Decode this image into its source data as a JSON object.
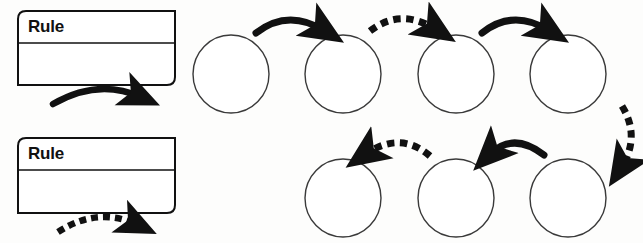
{
  "diagram": {
    "background_color": "#fdfdfc",
    "stroke_color": "#111111",
    "legend": {
      "items": [
        {
          "name": "rule-box-solid",
          "label": "Rule",
          "arrow_style": "solid",
          "arrow_direction": "right",
          "x": 18,
          "y": 11,
          "width": 157,
          "height": 74
        },
        {
          "name": "rule-box-dashed",
          "label": "Rule",
          "arrow_style": "dashed",
          "arrow_direction": "right",
          "x": 18,
          "y": 138,
          "width": 157,
          "height": 75
        }
      ]
    },
    "nodes": [
      {
        "id": "node-1",
        "row": "top",
        "index": 1,
        "cx": 231,
        "cy": 74,
        "rx": 38,
        "ry": 39,
        "label": ""
      },
      {
        "id": "node-2",
        "row": "top",
        "index": 2,
        "cx": 343,
        "cy": 74,
        "rx": 38,
        "ry": 39,
        "label": ""
      },
      {
        "id": "node-3",
        "row": "top",
        "index": 3,
        "cx": 456,
        "cy": 74,
        "rx": 38,
        "ry": 39,
        "label": ""
      },
      {
        "id": "node-4",
        "row": "top",
        "index": 4,
        "cx": 568,
        "cy": 74,
        "rx": 38,
        "ry": 39,
        "label": ""
      },
      {
        "id": "node-5",
        "row": "bottom",
        "index": 5,
        "cx": 568,
        "cy": 198,
        "rx": 38,
        "ry": 39,
        "label": ""
      },
      {
        "id": "node-6",
        "row": "bottom",
        "index": 6,
        "cx": 456,
        "cy": 198,
        "rx": 38,
        "ry": 39,
        "label": ""
      },
      {
        "id": "node-7",
        "row": "bottom",
        "index": 7,
        "cx": 343,
        "cy": 198,
        "rx": 38,
        "ry": 39,
        "label": ""
      }
    ],
    "connectors": [
      {
        "id": "arrow-1-2",
        "from": "node-1",
        "to": "node-2",
        "style": "solid",
        "direction": "right",
        "label": ""
      },
      {
        "id": "arrow-2-3",
        "from": "node-2",
        "to": "node-3",
        "style": "dashed",
        "direction": "right",
        "label": ""
      },
      {
        "id": "arrow-3-4",
        "from": "node-3",
        "to": "node-4",
        "style": "solid",
        "direction": "right",
        "label": ""
      },
      {
        "id": "arrow-4-5",
        "from": "node-4",
        "to": "node-5",
        "style": "dashed",
        "direction": "down",
        "label": ""
      },
      {
        "id": "arrow-5-6",
        "from": "node-5",
        "to": "node-6",
        "style": "solid",
        "direction": "left",
        "label": ""
      },
      {
        "id": "arrow-6-7",
        "from": "node-6",
        "to": "node-7",
        "style": "dashed",
        "direction": "left",
        "label": ""
      }
    ]
  }
}
